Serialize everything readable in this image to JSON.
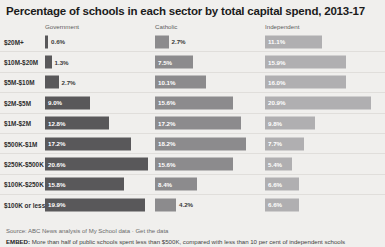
{
  "chart_data": {
    "type": "bar",
    "title": "Percentage of schools in each sector by total capital spend, 2013-17",
    "xlabel": "",
    "ylabel": "",
    "xlim": [
      0,
      22
    ],
    "grid": false,
    "legend_position": "top-as-column-headers",
    "categories": [
      "$20M+",
      "$10M-$20M",
      "$5M-$10M",
      "$2M-$5M",
      "$1M-$2M",
      "$500K-$1M",
      "$250K-$500K",
      "$100K-$250K",
      "$100K or less"
    ],
    "series": [
      {
        "name": "Government",
        "color": "#59585a",
        "values": [
          0.6,
          1.3,
          2.7,
          9.0,
          12.8,
          17.2,
          20.6,
          15.8,
          19.9
        ],
        "labels": [
          "0.6%",
          "1.3%",
          "2.7%",
          "9.0%",
          "12.8%",
          "17.2%",
          "20.6%",
          "15.8%",
          "19.9%"
        ]
      },
      {
        "name": "Catholic",
        "color": "#8c8b8d",
        "values": [
          2.7,
          7.5,
          10.1,
          15.6,
          17.2,
          18.2,
          15.6,
          8.4,
          4.2
        ],
        "labels": [
          "2.7%",
          "7.5%",
          "10.1%",
          "15.6%",
          "17.2%",
          "18.2%",
          "15.6%",
          "8.4%",
          "4.2%"
        ]
      },
      {
        "name": "Independent",
        "color": "#b0afb1",
        "values": [
          11.1,
          15.9,
          16.0,
          20.9,
          9.8,
          7.7,
          5.4,
          6.6,
          6.6
        ],
        "labels": [
          "11.1%",
          "15.9%",
          "16.0%",
          "20.9%",
          "9.8%",
          "7.7%",
          "5.4%",
          "6.6%",
          "6.6%"
        ]
      }
    ]
  },
  "footer": {
    "source_prefix": "Source: ABC News analysis of My School data",
    "source_separator": "·",
    "source_link": "Get the data",
    "embed_tag": "EMBED:",
    "embed_text": "More than half of public schools spent less than $500K, compared with less than 10 per cent of independent schools"
  }
}
